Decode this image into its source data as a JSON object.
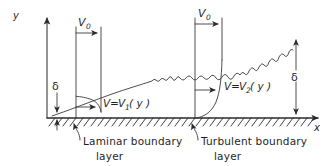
{
  "figure": {
    "type": "technical-diagram",
    "background_color": "#ffffff",
    "line_color": "#2b2b2b",
    "width": 333,
    "height": 166
  },
  "axes": {
    "y_label": "y",
    "x_label": "x",
    "y_axis_origin": [
      47,
      118
    ],
    "y_axis_tip": [
      47,
      14
    ],
    "x_axis_origin": [
      47,
      118
    ],
    "x_axis_tip": [
      322,
      118
    ]
  },
  "free_stream": {
    "laminar_label": "V",
    "laminar_subscript": "0",
    "turbulent_label": "V",
    "turbulent_subscript": "0"
  },
  "thickness": {
    "left_symbol": "δ",
    "right_symbol": "δ"
  },
  "profiles": [
    {
      "equation_lhs": "V",
      "equation_eq": "=",
      "equation_rhs": "V",
      "equation_subscript": "1",
      "equation_arg": "( y )",
      "regime": "laminar"
    },
    {
      "equation_lhs": "V",
      "equation_eq": "=",
      "equation_rhs": "V",
      "equation_subscript": "2",
      "equation_arg": "( y )",
      "regime": "turbulent"
    }
  ],
  "callouts": [
    {
      "line1": "Laminar boundary",
      "line2": "layer"
    },
    {
      "line1": "Turbulent boundary",
      "line2": "layer"
    }
  ]
}
